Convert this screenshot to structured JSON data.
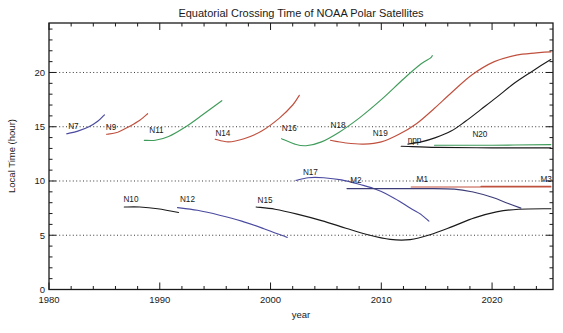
{
  "chart_data": {
    "type": "line",
    "title": "Equatorial Crossing Time of NOAA Polar Satellites",
    "xlabel": "year",
    "ylabel": "Local Time (hour)",
    "xlim": [
      1980,
      2025.5
    ],
    "ylim": [
      0,
      24.56
    ],
    "grid": "dotted horizontal lines at y-major ticks 5,10,15,20",
    "legend": "none (curves annotated with satellite names)",
    "plot": {
      "left": 49,
      "top": 23,
      "right": 553,
      "bottom": 289.5
    },
    "x_major_ticks": [
      1980,
      1990,
      2000,
      2010,
      2020
    ],
    "x_tick_labels": [
      "1980",
      "1990",
      "2000",
      "2010",
      "2020"
    ],
    "x_minor_step": 2,
    "y_major_ticks": [
      0,
      5,
      10,
      15,
      20
    ],
    "y_tick_labels": [
      "0",
      "5",
      "10",
      "15",
      "20"
    ],
    "y_minor_step": 1,
    "gridlines_y": [
      5,
      10,
      15,
      20
    ],
    "colors": {
      "blue": "#4a4aa0",
      "red": "#c0503e",
      "green": "#3f9c5a",
      "black": "#1a1a1a",
      "navy": "#3c3c78",
      "grid": "#222222"
    },
    "series": [
      {
        "name": "N7",
        "color": "blue",
        "points": [
          [
            1981.6,
            14.35
          ],
          [
            1982.6,
            14.6
          ],
          [
            1983.6,
            15.0
          ],
          [
            1984.4,
            15.5
          ],
          [
            1985.0,
            16.1
          ]
        ]
      },
      {
        "name": "N9",
        "color": "red",
        "points": [
          [
            1985.2,
            14.3
          ],
          [
            1986.2,
            14.5
          ],
          [
            1987.2,
            15.0
          ],
          [
            1988.2,
            15.6
          ],
          [
            1988.9,
            16.2
          ]
        ]
      },
      {
        "name": "N11",
        "color": "green",
        "points": [
          [
            1988.6,
            13.75
          ],
          [
            1989.6,
            13.75
          ],
          [
            1990.8,
            14.1
          ],
          [
            1992.2,
            14.9
          ],
          [
            1993.6,
            15.9
          ],
          [
            1994.8,
            16.8
          ],
          [
            1995.6,
            17.4
          ]
        ]
      },
      {
        "name": "N14",
        "color": "red",
        "points": [
          [
            1995.0,
            13.85
          ],
          [
            1996.2,
            13.6
          ],
          [
            1997.6,
            13.9
          ],
          [
            1999.2,
            14.6
          ],
          [
            2000.8,
            15.8
          ],
          [
            2002.0,
            17.0
          ],
          [
            2002.6,
            17.9
          ]
        ]
      },
      {
        "name": "N16",
        "color": "green",
        "points": [
          [
            2001.0,
            13.9
          ],
          [
            2002.2,
            13.4
          ],
          [
            2003.2,
            13.25
          ],
          [
            2004.6,
            13.6
          ],
          [
            2006.2,
            14.5
          ],
          [
            2008.0,
            15.8
          ],
          [
            2010.0,
            17.5
          ],
          [
            2012.0,
            19.4
          ],
          [
            2013.6,
            20.8
          ],
          [
            2014.4,
            21.3
          ],
          [
            2014.6,
            21.55
          ]
        ]
      },
      {
        "name": "N18/N19",
        "color": "red",
        "points": [
          [
            2005.4,
            13.75
          ],
          [
            2006.8,
            13.5
          ],
          [
            2008.4,
            13.4
          ],
          [
            2010.0,
            13.6
          ],
          [
            2011.6,
            14.3
          ],
          [
            2013.2,
            15.3
          ],
          [
            2014.8,
            16.7
          ],
          [
            2016.4,
            18.2
          ],
          [
            2018.2,
            19.8
          ],
          [
            2020.2,
            21.0
          ],
          [
            2022.2,
            21.6
          ],
          [
            2024.0,
            21.8
          ],
          [
            2025.3,
            21.9
          ]
        ]
      },
      {
        "name": "npp",
        "color": "black",
        "points": [
          [
            2011.8,
            13.2
          ],
          [
            2015.0,
            13.1
          ],
          [
            2020.0,
            13.05
          ],
          [
            2025.3,
            13.05
          ]
        ]
      },
      {
        "name": "N20",
        "color": "green",
        "points": [
          [
            2014.8,
            13.3
          ],
          [
            2020.0,
            13.3
          ],
          [
            2025.3,
            13.35
          ]
        ]
      },
      {
        "name": "afternoon-drift-black",
        "color": "black",
        "points": [
          [
            2012.4,
            13.4
          ],
          [
            2013.6,
            13.6
          ],
          [
            2014.9,
            14.0
          ],
          [
            2016.3,
            14.6
          ],
          [
            2017.6,
            15.5
          ],
          [
            2019.0,
            16.6
          ],
          [
            2020.4,
            17.7
          ],
          [
            2022.0,
            19.0
          ],
          [
            2023.6,
            20.1
          ],
          [
            2025.3,
            21.2
          ]
        ]
      },
      {
        "name": "N10",
        "color": "black",
        "points": [
          [
            1986.8,
            7.6
          ],
          [
            1988.2,
            7.6
          ],
          [
            1989.8,
            7.45
          ],
          [
            1991.7,
            7.1
          ]
        ]
      },
      {
        "name": "N12",
        "color": "blue",
        "points": [
          [
            1991.6,
            7.55
          ],
          [
            1993.4,
            7.3
          ],
          [
            1995.4,
            6.85
          ],
          [
            1997.4,
            6.3
          ],
          [
            1999.4,
            5.6
          ],
          [
            2001.5,
            4.8
          ]
        ]
      },
      {
        "name": "N15",
        "color": "black",
        "points": [
          [
            1998.7,
            7.6
          ],
          [
            2000.4,
            7.4
          ],
          [
            2002.4,
            6.95
          ],
          [
            2004.6,
            6.35
          ],
          [
            2006.8,
            5.65
          ],
          [
            2008.8,
            5.05
          ],
          [
            2010.8,
            4.62
          ],
          [
            2012.6,
            4.6
          ],
          [
            2014.4,
            5.05
          ],
          [
            2016.4,
            5.8
          ],
          [
            2018.4,
            6.6
          ],
          [
            2020.4,
            7.15
          ],
          [
            2022.4,
            7.4
          ],
          [
            2025.3,
            7.45
          ]
        ]
      },
      {
        "name": "N17",
        "color": "blue",
        "points": [
          [
            2002.3,
            10.05
          ],
          [
            2003.4,
            10.3
          ],
          [
            2004.8,
            10.3
          ],
          [
            2006.4,
            10.1
          ],
          [
            2008.0,
            9.7
          ],
          [
            2009.6,
            9.2
          ],
          [
            2011.2,
            8.4
          ],
          [
            2012.6,
            7.5
          ],
          [
            2013.6,
            6.9
          ],
          [
            2014.3,
            6.3
          ]
        ]
      },
      {
        "name": "M2",
        "color": "navy",
        "points": [
          [
            2006.9,
            9.3
          ],
          [
            2010.0,
            9.3
          ],
          [
            2014.0,
            9.3
          ],
          [
            2016.6,
            9.25
          ],
          [
            2018.2,
            9.0
          ],
          [
            2020.0,
            8.5
          ],
          [
            2021.4,
            7.95
          ],
          [
            2022.6,
            7.5
          ]
        ]
      },
      {
        "name": "M1",
        "color": "red",
        "points": [
          [
            2012.7,
            9.45
          ],
          [
            2018.0,
            9.45
          ],
          [
            2025.3,
            9.45
          ]
        ]
      },
      {
        "name": "M3",
        "color": "red",
        "points": [
          [
            2019.0,
            9.5
          ],
          [
            2025.3,
            9.5
          ]
        ]
      }
    ],
    "annotations": [
      {
        "text": "N7",
        "x": 1982.2,
        "y": 15.05
      },
      {
        "text": "N9",
        "x": 1985.6,
        "y": 15.0
      },
      {
        "text": "N11",
        "x": 1989.7,
        "y": 14.65
      },
      {
        "text": "N14",
        "x": 1995.7,
        "y": 14.45
      },
      {
        "text": "N16",
        "x": 2001.7,
        "y": 14.85
      },
      {
        "text": "N18",
        "x": 2006.1,
        "y": 15.15
      },
      {
        "text": "N19",
        "x": 2009.9,
        "y": 14.4
      },
      {
        "text": "npp",
        "x": 2013.0,
        "y": 13.75
      },
      {
        "text": "N20",
        "x": 2018.9,
        "y": 14.3
      },
      {
        "text": "N10",
        "x": 1987.4,
        "y": 8.3
      },
      {
        "text": "N12",
        "x": 1992.5,
        "y": 8.3
      },
      {
        "text": "N15",
        "x": 1999.5,
        "y": 8.2
      },
      {
        "text": "N17",
        "x": 2003.6,
        "y": 10.85
      },
      {
        "text": "M2",
        "x": 2007.7,
        "y": 10.1
      },
      {
        "text": "M1",
        "x": 2013.7,
        "y": 10.2
      },
      {
        "text": "M3",
        "x": 2025.4,
        "y": 10.2,
        "anchor": "end"
      }
    ]
  }
}
